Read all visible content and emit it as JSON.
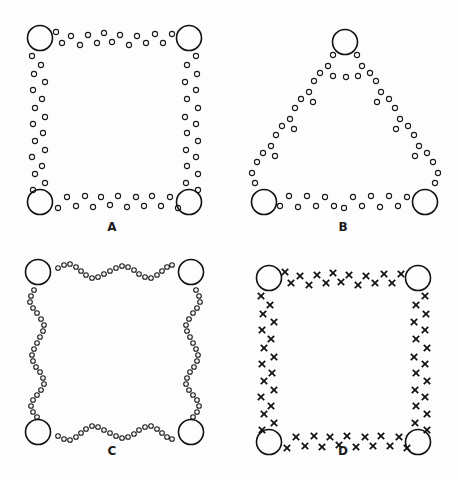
{
  "figure": {
    "background_color": "#fdfdfd",
    "ink_color": "#111111",
    "width": 458,
    "height": 480,
    "panel_width": 229,
    "panel_height": 240
  },
  "panels": [
    {
      "id": "panel-a",
      "label": "A",
      "shape": "square",
      "marker_style": "open-circle",
      "big_node_radius": 12.5,
      "small_node_radius": 2.6,
      "big_nodes": [
        {
          "x": 40,
          "y": 38
        },
        {
          "x": 189,
          "y": 38
        },
        {
          "x": 40,
          "y": 202
        },
        {
          "x": 189,
          "y": 202
        }
      ],
      "small_nodes": [
        {
          "x": 56,
          "y": 32
        },
        {
          "x": 62,
          "y": 43
        },
        {
          "x": 71,
          "y": 36
        },
        {
          "x": 80,
          "y": 45
        },
        {
          "x": 88,
          "y": 35
        },
        {
          "x": 97,
          "y": 43
        },
        {
          "x": 104,
          "y": 33
        },
        {
          "x": 112,
          "y": 42
        },
        {
          "x": 120,
          "y": 35
        },
        {
          "x": 129,
          "y": 45
        },
        {
          "x": 137,
          "y": 36
        },
        {
          "x": 146,
          "y": 43
        },
        {
          "x": 155,
          "y": 34
        },
        {
          "x": 163,
          "y": 43
        },
        {
          "x": 172,
          "y": 34
        },
        {
          "x": 32,
          "y": 56
        },
        {
          "x": 41,
          "y": 65
        },
        {
          "x": 34,
          "y": 74
        },
        {
          "x": 45,
          "y": 82
        },
        {
          "x": 33,
          "y": 90
        },
        {
          "x": 42,
          "y": 99
        },
        {
          "x": 35,
          "y": 108
        },
        {
          "x": 45,
          "y": 117
        },
        {
          "x": 33,
          "y": 124
        },
        {
          "x": 43,
          "y": 133
        },
        {
          "x": 35,
          "y": 141
        },
        {
          "x": 45,
          "y": 150
        },
        {
          "x": 32,
          "y": 157
        },
        {
          "x": 42,
          "y": 166
        },
        {
          "x": 35,
          "y": 174
        },
        {
          "x": 45,
          "y": 183
        },
        {
          "x": 33,
          "y": 190
        },
        {
          "x": 196,
          "y": 56
        },
        {
          "x": 187,
          "y": 65
        },
        {
          "x": 197,
          "y": 74
        },
        {
          "x": 185,
          "y": 82
        },
        {
          "x": 196,
          "y": 90
        },
        {
          "x": 187,
          "y": 99
        },
        {
          "x": 198,
          "y": 108
        },
        {
          "x": 185,
          "y": 117
        },
        {
          "x": 196,
          "y": 124
        },
        {
          "x": 187,
          "y": 133
        },
        {
          "x": 198,
          "y": 141
        },
        {
          "x": 186,
          "y": 150
        },
        {
          "x": 196,
          "y": 157
        },
        {
          "x": 187,
          "y": 166
        },
        {
          "x": 198,
          "y": 174
        },
        {
          "x": 186,
          "y": 183
        },
        {
          "x": 198,
          "y": 190
        },
        {
          "x": 58,
          "y": 208
        },
        {
          "x": 67,
          "y": 197
        },
        {
          "x": 76,
          "y": 206
        },
        {
          "x": 85,
          "y": 196
        },
        {
          "x": 93,
          "y": 207
        },
        {
          "x": 101,
          "y": 197
        },
        {
          "x": 110,
          "y": 205
        },
        {
          "x": 118,
          "y": 196
        },
        {
          "x": 127,
          "y": 207
        },
        {
          "x": 136,
          "y": 197
        },
        {
          "x": 144,
          "y": 206
        },
        {
          "x": 152,
          "y": 196
        },
        {
          "x": 161,
          "y": 206
        },
        {
          "x": 170,
          "y": 197
        },
        {
          "x": 178,
          "y": 208
        }
      ],
      "crosses": []
    },
    {
      "id": "panel-b",
      "label": "B",
      "shape": "triangle",
      "marker_style": "open-circle",
      "big_node_radius": 12.5,
      "small_node_radius": 2.6,
      "big_nodes": [
        {
          "x": 116,
          "y": 42
        },
        {
          "x": 35,
          "y": 202
        },
        {
          "x": 196,
          "y": 202
        }
      ],
      "small_nodes": [
        {
          "x": 104,
          "y": 55
        },
        {
          "x": 128,
          "y": 55
        },
        {
          "x": 99,
          "y": 66
        },
        {
          "x": 133,
          "y": 66
        },
        {
          "x": 91,
          "y": 73
        },
        {
          "x": 104,
          "y": 76
        },
        {
          "x": 117,
          "y": 77
        },
        {
          "x": 129,
          "y": 76
        },
        {
          "x": 141,
          "y": 73
        },
        {
          "x": 85,
          "y": 81
        },
        {
          "x": 147,
          "y": 81
        },
        {
          "x": 80,
          "y": 92
        },
        {
          "x": 152,
          "y": 92
        },
        {
          "x": 72,
          "y": 99
        },
        {
          "x": 84,
          "y": 102
        },
        {
          "x": 148,
          "y": 102
        },
        {
          "x": 160,
          "y": 99
        },
        {
          "x": 66,
          "y": 108
        },
        {
          "x": 166,
          "y": 108
        },
        {
          "x": 61,
          "y": 119
        },
        {
          "x": 171,
          "y": 119
        },
        {
          "x": 53,
          "y": 126
        },
        {
          "x": 65,
          "y": 129
        },
        {
          "x": 167,
          "y": 129
        },
        {
          "x": 179,
          "y": 126
        },
        {
          "x": 47,
          "y": 135
        },
        {
          "x": 185,
          "y": 135
        },
        {
          "x": 42,
          "y": 146
        },
        {
          "x": 190,
          "y": 146
        },
        {
          "x": 34,
          "y": 153
        },
        {
          "x": 46,
          "y": 156
        },
        {
          "x": 186,
          "y": 156
        },
        {
          "x": 198,
          "y": 153
        },
        {
          "x": 28,
          "y": 162
        },
        {
          "x": 204,
          "y": 162
        },
        {
          "x": 23,
          "y": 173
        },
        {
          "x": 209,
          "y": 173
        },
        {
          "x": 26,
          "y": 183
        },
        {
          "x": 206,
          "y": 183
        },
        {
          "x": 51,
          "y": 206
        },
        {
          "x": 60,
          "y": 196
        },
        {
          "x": 69,
          "y": 207
        },
        {
          "x": 78,
          "y": 196
        },
        {
          "x": 87,
          "y": 206
        },
        {
          "x": 96,
          "y": 197
        },
        {
          "x": 105,
          "y": 206
        },
        {
          "x": 115,
          "y": 208
        },
        {
          "x": 124,
          "y": 197
        },
        {
          "x": 133,
          "y": 206
        },
        {
          "x": 142,
          "y": 196
        },
        {
          "x": 151,
          "y": 207
        },
        {
          "x": 160,
          "y": 196
        },
        {
          "x": 169,
          "y": 206
        },
        {
          "x": 178,
          "y": 197
        }
      ],
      "crosses": []
    },
    {
      "id": "panel-c",
      "label": "C",
      "shape": "scalloped-square",
      "marker_style": "open-circle",
      "big_node_radius": 12.5,
      "small_node_radius": 2.3,
      "big_nodes": [
        {
          "x": 38,
          "y": 32
        },
        {
          "x": 191,
          "y": 32
        },
        {
          "x": 38,
          "y": 192
        },
        {
          "x": 191,
          "y": 192
        }
      ],
      "small_nodes": [
        {
          "x": 58,
          "y": 28
        },
        {
          "x": 64,
          "y": 25
        },
        {
          "x": 70,
          "y": 24
        },
        {
          "x": 76,
          "y": 27
        },
        {
          "x": 81,
          "y": 31
        },
        {
          "x": 86,
          "y": 35
        },
        {
          "x": 92,
          "y": 38
        },
        {
          "x": 98,
          "y": 37
        },
        {
          "x": 104,
          "y": 34
        },
        {
          "x": 110,
          "y": 31
        },
        {
          "x": 116,
          "y": 28
        },
        {
          "x": 122,
          "y": 26
        },
        {
          "x": 128,
          "y": 27
        },
        {
          "x": 134,
          "y": 30
        },
        {
          "x": 139,
          "y": 34
        },
        {
          "x": 145,
          "y": 37
        },
        {
          "x": 151,
          "y": 38
        },
        {
          "x": 157,
          "y": 35
        },
        {
          "x": 162,
          "y": 31
        },
        {
          "x": 167,
          "y": 27
        },
        {
          "x": 172,
          "y": 25
        },
        {
          "x": 34,
          "y": 50
        },
        {
          "x": 31,
          "y": 56
        },
        {
          "x": 30,
          "y": 62
        },
        {
          "x": 33,
          "y": 68
        },
        {
          "x": 37,
          "y": 73
        },
        {
          "x": 41,
          "y": 79
        },
        {
          "x": 44,
          "y": 85
        },
        {
          "x": 43,
          "y": 91
        },
        {
          "x": 40,
          "y": 97
        },
        {
          "x": 37,
          "y": 103
        },
        {
          "x": 34,
          "y": 109
        },
        {
          "x": 32,
          "y": 115
        },
        {
          "x": 33,
          "y": 121
        },
        {
          "x": 36,
          "y": 127
        },
        {
          "x": 40,
          "y": 132
        },
        {
          "x": 43,
          "y": 138
        },
        {
          "x": 44,
          "y": 144
        },
        {
          "x": 41,
          "y": 150
        },
        {
          "x": 37,
          "y": 155
        },
        {
          "x": 33,
          "y": 160
        },
        {
          "x": 31,
          "y": 166
        },
        {
          "x": 33,
          "y": 172
        },
        {
          "x": 37,
          "y": 177
        },
        {
          "x": 196,
          "y": 50
        },
        {
          "x": 199,
          "y": 56
        },
        {
          "x": 200,
          "y": 62
        },
        {
          "x": 197,
          "y": 68
        },
        {
          "x": 193,
          "y": 73
        },
        {
          "x": 189,
          "y": 79
        },
        {
          "x": 186,
          "y": 85
        },
        {
          "x": 187,
          "y": 91
        },
        {
          "x": 190,
          "y": 97
        },
        {
          "x": 193,
          "y": 103
        },
        {
          "x": 196,
          "y": 109
        },
        {
          "x": 198,
          "y": 115
        },
        {
          "x": 197,
          "y": 121
        },
        {
          "x": 194,
          "y": 127
        },
        {
          "x": 190,
          "y": 132
        },
        {
          "x": 187,
          "y": 138
        },
        {
          "x": 186,
          "y": 144
        },
        {
          "x": 189,
          "y": 150
        },
        {
          "x": 193,
          "y": 155
        },
        {
          "x": 197,
          "y": 160
        },
        {
          "x": 199,
          "y": 166
        },
        {
          "x": 197,
          "y": 172
        },
        {
          "x": 193,
          "y": 177
        },
        {
          "x": 58,
          "y": 196
        },
        {
          "x": 64,
          "y": 199
        },
        {
          "x": 70,
          "y": 200
        },
        {
          "x": 76,
          "y": 197
        },
        {
          "x": 81,
          "y": 193
        },
        {
          "x": 86,
          "y": 189
        },
        {
          "x": 92,
          "y": 186
        },
        {
          "x": 98,
          "y": 187
        },
        {
          "x": 104,
          "y": 190
        },
        {
          "x": 110,
          "y": 193
        },
        {
          "x": 116,
          "y": 196
        },
        {
          "x": 122,
          "y": 198
        },
        {
          "x": 128,
          "y": 197
        },
        {
          "x": 134,
          "y": 194
        },
        {
          "x": 139,
          "y": 190
        },
        {
          "x": 145,
          "y": 187
        },
        {
          "x": 151,
          "y": 186
        },
        {
          "x": 157,
          "y": 189
        },
        {
          "x": 162,
          "y": 193
        },
        {
          "x": 167,
          "y": 197
        },
        {
          "x": 172,
          "y": 199
        }
      ],
      "crosses": []
    },
    {
      "id": "panel-d",
      "label": "D",
      "shape": "square",
      "marker_style": "cross",
      "big_node_radius": 12.5,
      "cross_half_size": 3.2,
      "big_nodes": [
        {
          "x": 40,
          "y": 38
        },
        {
          "x": 189,
          "y": 38
        },
        {
          "x": 40,
          "y": 202
        },
        {
          "x": 189,
          "y": 202
        }
      ],
      "small_nodes": [],
      "crosses": [
        {
          "x": 56,
          "y": 32
        },
        {
          "x": 62,
          "y": 43
        },
        {
          "x": 71,
          "y": 36
        },
        {
          "x": 80,
          "y": 45
        },
        {
          "x": 88,
          "y": 35
        },
        {
          "x": 97,
          "y": 43
        },
        {
          "x": 104,
          "y": 33
        },
        {
          "x": 112,
          "y": 42
        },
        {
          "x": 120,
          "y": 35
        },
        {
          "x": 129,
          "y": 45
        },
        {
          "x": 137,
          "y": 36
        },
        {
          "x": 146,
          "y": 43
        },
        {
          "x": 155,
          "y": 34
        },
        {
          "x": 163,
          "y": 43
        },
        {
          "x": 172,
          "y": 34
        },
        {
          "x": 32,
          "y": 56
        },
        {
          "x": 41,
          "y": 65
        },
        {
          "x": 34,
          "y": 74
        },
        {
          "x": 45,
          "y": 82
        },
        {
          "x": 33,
          "y": 90
        },
        {
          "x": 42,
          "y": 99
        },
        {
          "x": 35,
          "y": 108
        },
        {
          "x": 45,
          "y": 117
        },
        {
          "x": 33,
          "y": 124
        },
        {
          "x": 43,
          "y": 133
        },
        {
          "x": 35,
          "y": 141
        },
        {
          "x": 45,
          "y": 150
        },
        {
          "x": 32,
          "y": 157
        },
        {
          "x": 42,
          "y": 166
        },
        {
          "x": 35,
          "y": 174
        },
        {
          "x": 45,
          "y": 183
        },
        {
          "x": 33,
          "y": 190
        },
        {
          "x": 196,
          "y": 56
        },
        {
          "x": 187,
          "y": 65
        },
        {
          "x": 197,
          "y": 74
        },
        {
          "x": 185,
          "y": 82
        },
        {
          "x": 196,
          "y": 90
        },
        {
          "x": 187,
          "y": 99
        },
        {
          "x": 198,
          "y": 108
        },
        {
          "x": 185,
          "y": 117
        },
        {
          "x": 196,
          "y": 124
        },
        {
          "x": 187,
          "y": 133
        },
        {
          "x": 198,
          "y": 141
        },
        {
          "x": 186,
          "y": 150
        },
        {
          "x": 196,
          "y": 157
        },
        {
          "x": 187,
          "y": 166
        },
        {
          "x": 198,
          "y": 174
        },
        {
          "x": 186,
          "y": 183
        },
        {
          "x": 198,
          "y": 190
        },
        {
          "x": 58,
          "y": 208
        },
        {
          "x": 67,
          "y": 197
        },
        {
          "x": 76,
          "y": 206
        },
        {
          "x": 85,
          "y": 196
        },
        {
          "x": 93,
          "y": 207
        },
        {
          "x": 101,
          "y": 197
        },
        {
          "x": 110,
          "y": 205
        },
        {
          "x": 118,
          "y": 196
        },
        {
          "x": 127,
          "y": 207
        },
        {
          "x": 136,
          "y": 197
        },
        {
          "x": 144,
          "y": 206
        },
        {
          "x": 152,
          "y": 196
        },
        {
          "x": 161,
          "y": 206
        },
        {
          "x": 170,
          "y": 197
        },
        {
          "x": 178,
          "y": 208
        }
      ]
    }
  ]
}
